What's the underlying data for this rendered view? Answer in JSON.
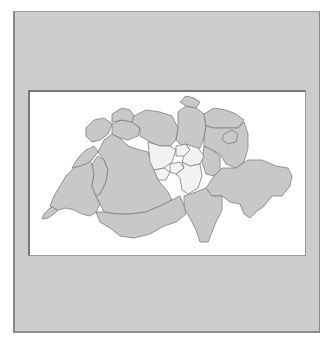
{
  "figure": {
    "colors": {
      "frame_background": "#cccccc",
      "panel_background": "#ffffff",
      "canton_default": "#c8c8c8",
      "canton_highlighted": "#f2f2f2",
      "border": "#7e7e7e"
    },
    "highlighted_region": [
      "Lucerne",
      "Zug",
      "Schwyz",
      "Obwalden",
      "Nidwalden",
      "Uri"
    ],
    "cantons_default": [
      "Geneva",
      "Vaud",
      "Neuchâtel",
      "Jura",
      "Fribourg",
      "Bern",
      "Solothurn",
      "Basel",
      "Aargau",
      "Zurich",
      "Schaffhausen",
      "Thurgau",
      "St. Gallen",
      "Appenzell",
      "Glarus",
      "Graubünden",
      "Ticino",
      "Valais"
    ]
  }
}
